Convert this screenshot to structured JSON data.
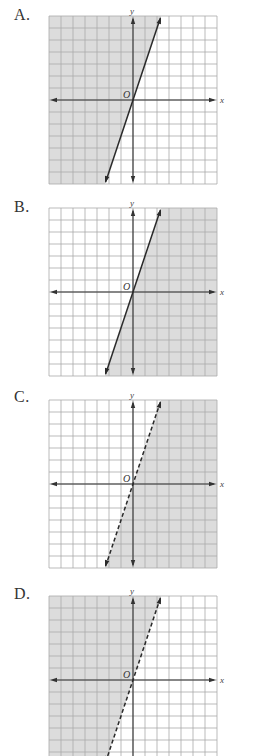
{
  "chart_data": [
    {
      "type": "line",
      "label": "A.",
      "title": "A.",
      "xlabel": "x",
      "ylabel": "y",
      "origin_label": "O",
      "xlim": [
        -7,
        7
      ],
      "ylim": [
        -7,
        7
      ],
      "grid": true,
      "boundary": {
        "equation": "y = 3x",
        "slope": 3,
        "intercept": 0,
        "style": "solid"
      },
      "shaded_region": "left/above line",
      "inequality": "y >= 3x"
    },
    {
      "type": "line",
      "label": "B.",
      "title": "B.",
      "xlabel": "x",
      "ylabel": "y",
      "origin_label": "O",
      "xlim": [
        -7,
        7
      ],
      "ylim": [
        -7,
        7
      ],
      "grid": true,
      "boundary": {
        "equation": "y = 3x",
        "slope": 3,
        "intercept": 0,
        "style": "solid"
      },
      "shaded_region": "right/below line",
      "inequality": "y <= 3x"
    },
    {
      "type": "line",
      "label": "C.",
      "title": "C.",
      "xlabel": "x",
      "ylabel": "y",
      "origin_label": "O",
      "xlim": [
        -7,
        7
      ],
      "ylim": [
        -7,
        7
      ],
      "grid": true,
      "boundary": {
        "equation": "y = 3x",
        "slope": 3,
        "intercept": 0,
        "style": "dashed"
      },
      "shaded_region": "right/below line",
      "inequality": "y < 3x"
    },
    {
      "type": "line",
      "label": "D.",
      "title": "D.",
      "xlabel": "x",
      "ylabel": "y",
      "origin_label": "O",
      "xlim": [
        -7,
        7
      ],
      "ylim": [
        -7,
        7
      ],
      "grid": true,
      "boundary": {
        "equation": "y = 3x",
        "slope": 3,
        "intercept": 0,
        "style": "dashed"
      },
      "shaded_region": "left/above line",
      "inequality": "y > 3x"
    }
  ],
  "panels": [
    {
      "label": "A.",
      "top": 16,
      "label_top": 6,
      "shade": "left",
      "dashed": false,
      "clip_bottom": null
    },
    {
      "label": "B.",
      "top": 208,
      "label_top": 198,
      "shade": "right",
      "dashed": false,
      "clip_bottom": null
    },
    {
      "label": "C.",
      "top": 400,
      "label_top": 388,
      "shade": "right",
      "dashed": true,
      "clip_bottom": null
    },
    {
      "label": "D.",
      "top": 596,
      "label_top": 585,
      "shade": "left",
      "dashed": true,
      "clip_bottom": 756
    }
  ],
  "colors": {
    "shade": "#dcdcdc",
    "grid": "#a9a9a9",
    "axis": "#333333",
    "line": "#2a2a2a"
  }
}
